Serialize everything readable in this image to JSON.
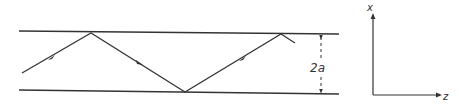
{
  "diagram": {
    "labels": {
      "thickness": "2a",
      "axis_vertical": "x",
      "axis_horizontal": "z"
    },
    "colors": {
      "stroke": "#333333",
      "background": "#ffffff"
    },
    "waveguide": {
      "top_line": {
        "x1": 19,
        "y1": 31,
        "x2": 339,
        "y2": 34
      },
      "bottom_line": {
        "x1": 19,
        "y1": 90,
        "x2": 339,
        "y2": 94
      }
    },
    "ray_points": [
      [
        22,
        73
      ],
      [
        91,
        33
      ],
      [
        185,
        92
      ],
      [
        281,
        34
      ],
      [
        295,
        43
      ]
    ],
    "ray_arrows": [
      "arrow-up-right",
      "arrow-down-right",
      "arrow-up-right"
    ],
    "dimension": {
      "x": 321,
      "y_top": 35,
      "y_bottom": 93
    },
    "axes": {
      "origin": [
        373,
        95
      ],
      "x_end": [
        373,
        14
      ],
      "z_end": [
        441,
        95
      ]
    }
  }
}
